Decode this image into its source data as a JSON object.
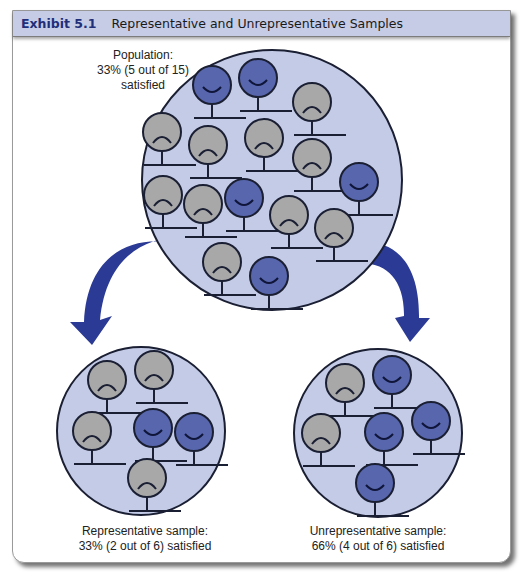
{
  "header": {
    "exhibit_number": "Exhibit 5.1",
    "title": "Representative and Unrepresentative Samples"
  },
  "population": {
    "label_line1": "Population:",
    "label_line2": "33% (5 out of 15)",
    "label_line3": "satisfied",
    "total": 15,
    "satisfied": 5
  },
  "representative_sample": {
    "label_line1": "Representative sample:",
    "label_line2": "33% (2 out of 6) satisfied",
    "total": 6,
    "satisfied": 2
  },
  "unrepresentative_sample": {
    "label_line1": "Unrepresentative sample:",
    "label_line2": "66% (4 out of 6) satisfied",
    "total": 6,
    "satisfied": 4
  },
  "colors": {
    "header_bg": "#c6cce6",
    "header_number": "#1f2f7a",
    "circle_bg": "#c3cbe6",
    "satisfied_face": "#5766ad",
    "unsatisfied_face": "#a8a8a8",
    "arrow": "#2b3a94"
  },
  "legend_icons": {
    "satisfied": "smiley-face-icon",
    "unsatisfied": "frowning-face-icon"
  }
}
